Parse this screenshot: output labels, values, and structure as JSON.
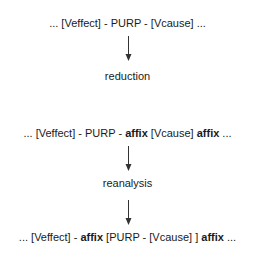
{
  "diagram": {
    "stages": [
      {
        "segments": [
          {
            "text": "... [Veffect] - PURP - [Vcause] ...",
            "bold": false
          }
        ]
      },
      {
        "segments": [
          {
            "text": "... [Veffect] - PURP - ",
            "bold": false
          },
          {
            "text": "affix",
            "bold": true
          },
          {
            "text": " [Vcause] ",
            "bold": false
          },
          {
            "text": "affix",
            "bold": true
          },
          {
            "text": " ...",
            "bold": false
          }
        ]
      },
      {
        "segments": [
          {
            "text": "... [Veffect] - ",
            "bold": false
          },
          {
            "text": "affix",
            "bold": true
          },
          {
            "text": " [PURP - [Vcause] ] ",
            "bold": false
          },
          {
            "text": "affix",
            "bold": true
          },
          {
            "text": " ...",
            "bold": false
          }
        ]
      }
    ],
    "transitions": [
      {
        "label": "reduction"
      },
      {
        "label": "reanalysis"
      }
    ],
    "colors": {
      "text": "#1a1a1a",
      "arrow": "#333333"
    }
  }
}
